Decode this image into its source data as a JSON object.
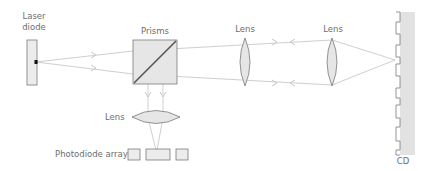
{
  "diagram": {
    "labels": {
      "laser_line1": "Laser",
      "laser_line2": "diode",
      "prisms": "Prisms",
      "lens_1": "Lens",
      "lens_2": "Lens",
      "lens_3": "Lens",
      "photodiode": "Photodiode array",
      "cd": "CD"
    },
    "colors": {
      "beam": "#c8c8c8",
      "component_fill": "#ececec",
      "outline": "#7a7a7a",
      "cd_fill": "#e2e2e2",
      "label": "#6e6e6e",
      "emitter": "#111111"
    },
    "components": [
      "laser-diode",
      "prism-beam-splitter",
      "collimating-lens",
      "objective-lens",
      "cd-disc",
      "focusing-lens",
      "photodiode-array"
    ]
  }
}
